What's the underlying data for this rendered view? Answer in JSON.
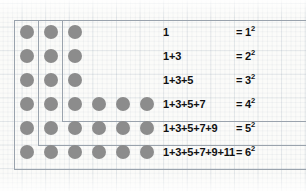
{
  "figure": {
    "background": "graph-paper",
    "dot_color": "#8c8c8c",
    "line_color": "#9aa3ad",
    "text_color": "#111111"
  },
  "chart_data": {
    "type": "table",
    "xlabel": "",
    "ylabel": "",
    "categories": [
      "1",
      "2",
      "3",
      "4",
      "5",
      "6"
    ],
    "values": [
      1,
      4,
      9,
      16,
      25,
      36
    ],
    "series": [
      {
        "name": "odd terms added",
        "values": [
          1,
          3,
          5,
          7,
          9,
          11
        ]
      },
      {
        "name": "running total (square)",
        "values": [
          1,
          4,
          9,
          16,
          25,
          36
        ]
      },
      {
        "name": "side length n",
        "values": [
          1,
          2,
          3,
          4,
          5,
          6
        ]
      }
    ],
    "rows": [
      {
        "index": 1,
        "sum_text": "1",
        "result_text": "= 1",
        "exponent": "2",
        "base": "1",
        "value": 1,
        "dots_in_gnomon": 1
      },
      {
        "index": 2,
        "sum_text": "1+3",
        "result_text": "= 2",
        "exponent": "2",
        "base": "2",
        "value": 4,
        "dots_in_gnomon": 3
      },
      {
        "index": 3,
        "sum_text": "1+3+5",
        "result_text": "= 3",
        "exponent": "2",
        "base": "3",
        "value": 9,
        "dots_in_gnomon": 5
      },
      {
        "index": 4,
        "sum_text": "1+3+5+7",
        "result_text": "= 4",
        "exponent": "2",
        "base": "4",
        "value": 16,
        "dots_in_gnomon": 7
      },
      {
        "index": 5,
        "sum_text": "1+3+5+7+9",
        "result_text": "= 5",
        "exponent": "2",
        "base": "5",
        "value": 25,
        "dots_in_gnomon": 9
      },
      {
        "index": 6,
        "sum_text": "1+3+5+7+9+11",
        "result_text": "= 6",
        "exponent": "2",
        "base": "6",
        "value": 36,
        "dots_in_gnomon": 11
      }
    ],
    "grid": true,
    "legend": "none"
  },
  "equations": [
    {
      "lhs": "1",
      "rhs_prefix": "= 1",
      "rhs_exp": "2"
    },
    {
      "lhs": "1+3",
      "rhs_prefix": "= 2",
      "rhs_exp": "2"
    },
    {
      "lhs": "1+3+5",
      "rhs_prefix": "= 3",
      "rhs_exp": "2"
    },
    {
      "lhs": "1+3+5+7",
      "rhs_prefix": "= 4",
      "rhs_exp": "2"
    },
    {
      "lhs": "1+3+5+7+9",
      "rhs_prefix": "= 5",
      "rhs_exp": "2"
    },
    {
      "lhs": "1+3+5+7+9+11",
      "rhs_prefix": "= 6",
      "rhs_exp": "2"
    }
  ],
  "dot_matrix": {
    "rows": 6,
    "cols": 6,
    "occupied": [
      [
        1,
        1,
        1,
        0,
        0,
        0
      ],
      [
        1,
        1,
        1,
        0,
        0,
        0
      ],
      [
        1,
        1,
        1,
        0,
        0,
        0
      ],
      [
        1,
        1,
        1,
        1,
        1,
        1
      ],
      [
        1,
        1,
        1,
        1,
        1,
        1
      ],
      [
        1,
        1,
        1,
        1,
        1,
        1
      ]
    ]
  },
  "gnomon_boxes": [
    {
      "label": "gnomon-1"
    },
    {
      "label": "gnomon-2"
    },
    {
      "label": "gnomon-3"
    }
  ]
}
